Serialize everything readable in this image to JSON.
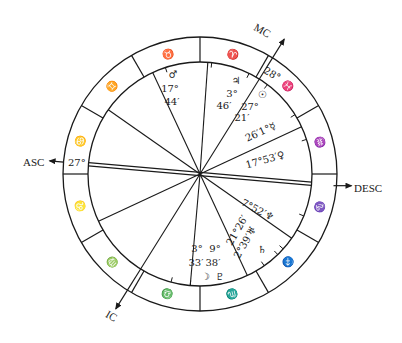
{
  "chart_title": "",
  "center": {
    "x": 200,
    "y": 174
  },
  "radii": {
    "outer": 137,
    "inner": 112
  },
  "zodiac_dividers_deg": [
    0,
    30,
    60,
    90,
    120,
    150,
    180,
    210,
    240,
    270,
    300,
    330
  ],
  "signs": [
    {
      "name": "aries",
      "glyph": "♈",
      "angle": 75
    },
    {
      "name": "taurus",
      "glyph": "♉",
      "angle": 105
    },
    {
      "name": "gemini",
      "glyph": "♊",
      "angle": 135
    },
    {
      "name": "cancer",
      "glyph": "♋",
      "angle": 165
    },
    {
      "name": "leo",
      "glyph": "♌",
      "angle": 195
    },
    {
      "name": "virgo",
      "glyph": "♍",
      "angle": 225
    },
    {
      "name": "libra",
      "glyph": "♎",
      "angle": 255
    },
    {
      "name": "scorpio",
      "glyph": "♏",
      "angle": 285
    },
    {
      "name": "sagittarius",
      "glyph": "♐",
      "angle": 315
    },
    {
      "name": "capricorn",
      "glyph": "♑",
      "angle": 345
    },
    {
      "name": "aquarius",
      "glyph": "♒",
      "angle": 15
    },
    {
      "name": "pisces",
      "glyph": "♓",
      "angle": 45
    }
  ],
  "house_cusps_deg": [
    175,
    145,
    115,
    86,
    58,
    25,
    -5,
    -35,
    -65,
    265,
    238,
    205
  ],
  "axes": {
    "asc": {
      "label": "ASC",
      "degree": "27°",
      "angle": 175
    },
    "mc": {
      "label": "MC",
      "degree": "28°",
      "angle": 58
    },
    "desc": {
      "label": "DESC",
      "angle": -5
    },
    "ic": {
      "label": "IC",
      "angle": 238
    }
  },
  "labels": [
    {
      "name": "mars",
      "text": "♂",
      "x": 173,
      "y": 78
    },
    {
      "name": "mars-deg",
      "text": "17°",
      "x": 170,
      "y": 92
    },
    {
      "name": "mars-min",
      "text": "44′",
      "x": 172,
      "y": 105
    },
    {
      "name": "jupiter",
      "text": "♃",
      "x": 236,
      "y": 84
    },
    {
      "name": "jupiter-deg",
      "text": "3°",
      "x": 232,
      "y": 97
    },
    {
      "name": "jupiter-min",
      "text": "46′",
      "x": 224,
      "y": 109
    },
    {
      "name": "sun",
      "text": "☉",
      "x": 262,
      "y": 98
    },
    {
      "name": "sun-deg",
      "text": "27°",
      "x": 250,
      "y": 110
    },
    {
      "name": "sun-min",
      "text": "21′",
      "x": 242,
      "y": 121
    },
    {
      "name": "mercury",
      "text": "26′1°☿",
      "x": 262,
      "y": 135,
      "rotate": -25
    },
    {
      "name": "venus",
      "text": "17°53′♀",
      "x": 266,
      "y": 163,
      "rotate": -16
    },
    {
      "name": "neptune",
      "text": "7°52′♆",
      "x": 256,
      "y": 213,
      "rotate": 28
    },
    {
      "name": "uranus-deg",
      "text": "21°26′",
      "x": 240,
      "y": 232,
      "rotate": -60
    },
    {
      "name": "uranus",
      "text": "2°39′♅",
      "x": 248,
      "y": 244,
      "rotate": -60
    },
    {
      "name": "saturn",
      "text": "♄",
      "x": 262,
      "y": 253
    },
    {
      "name": "moon-deg",
      "text": "3°",
      "x": 197,
      "y": 252
    },
    {
      "name": "pluto-deg",
      "text": "9°",
      "x": 215,
      "y": 252
    },
    {
      "name": "moon-min",
      "text": "33′",
      "x": 196,
      "y": 266
    },
    {
      "name": "pluto-min",
      "text": "38′",
      "x": 213,
      "y": 266
    },
    {
      "name": "moon",
      "text": "☽",
      "x": 205,
      "y": 280
    },
    {
      "name": "pluto",
      "text": "♇",
      "x": 220,
      "y": 280
    }
  ],
  "planet_ticks_deg": [
    108,
    84,
    64,
    53,
    32,
    18,
    -22,
    -42,
    -46,
    -55,
    265,
    255
  ]
}
